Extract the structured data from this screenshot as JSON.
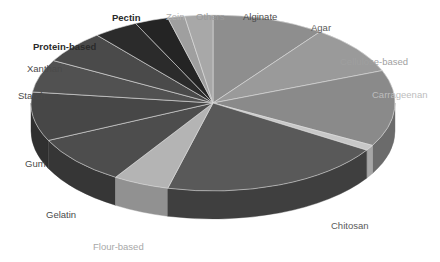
{
  "chart_data": {
    "type": "pie",
    "title": "",
    "subtitle": "",
    "xlabel": "",
    "ylabel": "",
    "grid": false,
    "legend_position": "none",
    "label_placement": "outside-callout",
    "three_d": true,
    "start_angle_deg": 0,
    "direction": "clockwise",
    "geometry": {
      "center_x": 213,
      "center_y": 103,
      "radius_x": 182,
      "radius_y": 88,
      "depth": 28
    },
    "categories": [
      "Alginate",
      "Agar",
      "Cellulose-based",
      "Carrageenan",
      "Chitosan",
      "Flour-based",
      "Gelatin",
      "Gum",
      "Starch",
      "Xanthan",
      "Protein-based",
      "Pectin",
      "Zein",
      "Others"
    ],
    "values": [
      10.0,
      9.0,
      14.0,
      1.0,
      20.0,
      5.0,
      9.0,
      9.0,
      6.0,
      6.0,
      4.0,
      3.0,
      1.5,
      2.5
    ],
    "units": "percent",
    "slices": [
      {
        "label": "Alginate",
        "value": 10.0,
        "color": "#8e8e8e",
        "side_color": "#6f6f6f",
        "start_deg": 0.0,
        "end_deg": 36.0
      },
      {
        "label": "Agar",
        "value": 9.0,
        "color": "#9a9a9a",
        "side_color": "#7a7a7a",
        "start_deg": 36.0,
        "end_deg": 68.4
      },
      {
        "label": "Cellulose-based",
        "value": 14.0,
        "color": "#8a8a8a",
        "side_color": "#6b6b6b",
        "start_deg": 68.4,
        "end_deg": 118.8
      },
      {
        "label": "Carrageenan",
        "value": 1.0,
        "color": "#c8c8c8",
        "side_color": "#a6a6a6",
        "start_deg": 118.8,
        "end_deg": 122.4
      },
      {
        "label": "Chitosan",
        "value": 20.0,
        "color": "#595959",
        "side_color": "#3f3f3f",
        "start_deg": 122.4,
        "end_deg": 194.4
      },
      {
        "label": "Flour-based",
        "value": 5.0,
        "color": "#b4b4b4",
        "side_color": "#919191",
        "start_deg": 194.4,
        "end_deg": 212.4
      },
      {
        "label": "Gelatin",
        "value": 9.0,
        "color": "#4d4d4d",
        "side_color": "#363636",
        "start_deg": 212.4,
        "end_deg": 244.8
      },
      {
        "label": "Gum",
        "value": 9.0,
        "color": "#474747",
        "side_color": "#303030",
        "start_deg": 244.8,
        "end_deg": 277.2
      },
      {
        "label": "Starch",
        "value": 6.0,
        "color": "#515151",
        "side_color": "#393939",
        "start_deg": 277.2,
        "end_deg": 298.8
      },
      {
        "label": "Xanthan",
        "value": 6.0,
        "color": "#4a4a4a",
        "side_color": "#333333",
        "start_deg": 298.8,
        "end_deg": 320.4
      },
      {
        "label": "Protein-based",
        "value": 4.0,
        "color": "#2b2b2b",
        "side_color": "#1c1c1c",
        "start_deg": 320.4,
        "end_deg": 334.8
      },
      {
        "label": "Pectin",
        "value": 3.0,
        "color": "#242424",
        "side_color": "#161616",
        "start_deg": 334.8,
        "end_deg": 345.6
      },
      {
        "label": "Zein",
        "value": 1.5,
        "color": "#9f9f9f",
        "side_color": "#7d7d7d",
        "start_deg": 345.6,
        "end_deg": 351.0
      },
      {
        "label": "Others",
        "value": 2.5,
        "color": "#a8a8a8",
        "side_color": "#868686",
        "start_deg": 351.0,
        "end_deg": 360.0
      }
    ]
  },
  "labels": [
    {
      "text": "Pectin",
      "x": 112,
      "y": 13,
      "color": "#2b2b2b",
      "weight": "bold",
      "size": 9.5
    },
    {
      "text": "Zein",
      "x": 166,
      "y": 12,
      "color": "#b0b0b0",
      "weight": "normal",
      "size": 9.5
    },
    {
      "text": "Others",
      "x": 196,
      "y": 12,
      "color": "#9a9a9a",
      "weight": "normal",
      "size": 9.5
    },
    {
      "text": "Alginate",
      "x": 243,
      "y": 12,
      "color": "#4a4a4a",
      "weight": "normal",
      "size": 9.5
    },
    {
      "text": "Agar",
      "x": 311,
      "y": 23,
      "color": "#5a5a5a",
      "weight": "normal",
      "size": 9.5
    },
    {
      "text": "Cellulose-based",
      "x": 340,
      "y": 57,
      "color": "#9f9f9f",
      "weight": "normal",
      "size": 9.5
    },
    {
      "text": "Carrageenan",
      "x": 372,
      "y": 90,
      "color": "#bdbdbd",
      "weight": "normal",
      "size": 9.5
    },
    {
      "text": "Protein-based",
      "x": 33,
      "y": 42,
      "color": "#2b2b2b",
      "weight": "bold",
      "size": 9.5
    },
    {
      "text": "Xanthan",
      "x": 27,
      "y": 64,
      "color": "#4a4a4a",
      "weight": "normal",
      "size": 9.5
    },
    {
      "text": "Starch",
      "x": 18,
      "y": 91,
      "color": "#4a4a4a",
      "weight": "normal",
      "size": 9.5
    },
    {
      "text": "Gum",
      "x": 25,
      "y": 159,
      "color": "#4a4a4a",
      "weight": "normal",
      "size": 9.5
    },
    {
      "text": "Gelatin",
      "x": 46,
      "y": 210,
      "color": "#4a4a4a",
      "weight": "normal",
      "size": 9.5
    },
    {
      "text": "Flour-based",
      "x": 93,
      "y": 242,
      "color": "#a8a8a8",
      "weight": "normal",
      "size": 9.5
    },
    {
      "text": "Chitosan",
      "x": 331,
      "y": 221,
      "color": "#5a5a5a",
      "weight": "normal",
      "size": 9.5
    }
  ]
}
